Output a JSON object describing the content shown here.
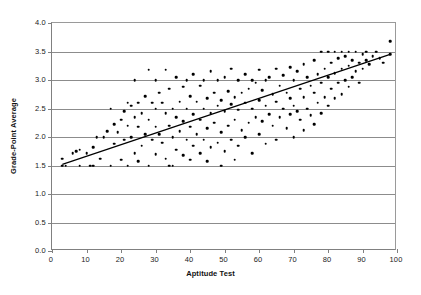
{
  "chart_data": {
    "type": "scatter",
    "title": "",
    "xlabel": "Aptitude Test",
    "ylabel": "Grade-Point Average",
    "xlim": [
      0,
      100
    ],
    "ylim": [
      0.0,
      4.0
    ],
    "xticks": [
      "0",
      "10",
      "20",
      "30",
      "40",
      "50",
      "60",
      "70",
      "80",
      "90",
      "100"
    ],
    "yticks": [
      "0.0",
      "0.5",
      "1.0",
      "1.5",
      "2.0",
      "2.5",
      "3.0",
      "3.5",
      "4.0"
    ],
    "grid": "horizontal",
    "legend": "none",
    "marker_color": "#000000",
    "gridline_color": "#8c8c8c",
    "axis_color": "#808080",
    "trendline": {
      "label": "linear fit",
      "color": "#000000",
      "x_start": 3,
      "y_start": 1.52,
      "x_end": 98,
      "y_end": 3.45
    },
    "points": [
      [
        3,
        1.5
      ],
      [
        3,
        1.62
      ],
      [
        4,
        1.5
      ],
      [
        6,
        1.72
      ],
      [
        7,
        1.75
      ],
      [
        8,
        1.78
      ],
      [
        8,
        1.5
      ],
      [
        10,
        1.72
      ],
      [
        11,
        1.5
      ],
      [
        12,
        1.82
      ],
      [
        12,
        1.5
      ],
      [
        13,
        2.0
      ],
      [
        14,
        1.62
      ],
      [
        15,
        2.0
      ],
      [
        16,
        2.1
      ],
      [
        17,
        2.5
      ],
      [
        17,
        1.5
      ],
      [
        18,
        2.22
      ],
      [
        18,
        1.88
      ],
      [
        19,
        2.08
      ],
      [
        20,
        2.3
      ],
      [
        20,
        1.6
      ],
      [
        21,
        2.45
      ],
      [
        21,
        1.95
      ],
      [
        22,
        2.6
      ],
      [
        22,
        2.2
      ],
      [
        22,
        1.5
      ],
      [
        23,
        2.55
      ],
      [
        23,
        2.0
      ],
      [
        24,
        3.0
      ],
      [
        24,
        2.35
      ],
      [
        24,
        1.72
      ],
      [
        25,
        2.6
      ],
      [
        25,
        2.18
      ],
      [
        25,
        1.58
      ],
      [
        26,
        2.42
      ],
      [
        26,
        1.85
      ],
      [
        27,
        2.72
      ],
      [
        27,
        2.05
      ],
      [
        28,
        3.18
      ],
      [
        28,
        2.3
      ],
      [
        28,
        1.5
      ],
      [
        29,
        2.6
      ],
      [
        29,
        1.95
      ],
      [
        30,
        3.0
      ],
      [
        30,
        2.5
      ],
      [
        30,
        2.18
      ],
      [
        30,
        1.7
      ],
      [
        31,
        2.78
      ],
      [
        31,
        2.05
      ],
      [
        32,
        2.6
      ],
      [
        32,
        1.9
      ],
      [
        33,
        3.18
      ],
      [
        33,
        2.42
      ],
      [
        33,
        1.62
      ],
      [
        34,
        2.85
      ],
      [
        34,
        2.2
      ],
      [
        34,
        1.5
      ],
      [
        35,
        2.5
      ],
      [
        35,
        2.0
      ],
      [
        35,
        1.5
      ],
      [
        36,
        3.05
      ],
      [
        36,
        2.35
      ],
      [
        36,
        1.78
      ],
      [
        37,
        2.62
      ],
      [
        37,
        2.1
      ],
      [
        38,
        2.88
      ],
      [
        38,
        2.28
      ],
      [
        38,
        1.68
      ],
      [
        39,
        3.0
      ],
      [
        39,
        2.5
      ],
      [
        39,
        1.95
      ],
      [
        40,
        2.72
      ],
      [
        40,
        2.18
      ],
      [
        40,
        1.6
      ],
      [
        41,
        3.1
      ],
      [
        41,
        2.4
      ],
      [
        41,
        1.85
      ],
      [
        42,
        2.62
      ],
      [
        42,
        2.05
      ],
      [
        43,
        2.9
      ],
      [
        43,
        2.3
      ],
      [
        43,
        1.72
      ],
      [
        44,
        3.0
      ],
      [
        44,
        2.5
      ],
      [
        44,
        1.95
      ],
      [
        45,
        2.68
      ],
      [
        45,
        2.15
      ],
      [
        45,
        1.58
      ],
      [
        46,
        3.15
      ],
      [
        46,
        2.42
      ],
      [
        46,
        1.82
      ],
      [
        47,
        2.78
      ],
      [
        47,
        2.25
      ],
      [
        48,
        3.0
      ],
      [
        48,
        2.55
      ],
      [
        48,
        1.9
      ],
      [
        49,
        2.65
      ],
      [
        49,
        2.08
      ],
      [
        49,
        1.5
      ],
      [
        50,
        3.05
      ],
      [
        50,
        2.45
      ],
      [
        50,
        1.75
      ],
      [
        51,
        2.8
      ],
      [
        51,
        2.2
      ],
      [
        52,
        3.2
      ],
      [
        52,
        2.58
      ],
      [
        52,
        1.95
      ],
      [
        53,
        2.7
      ],
      [
        53,
        2.3
      ],
      [
        53,
        1.6
      ],
      [
        54,
        3.0
      ],
      [
        54,
        2.48
      ],
      [
        54,
        1.85
      ],
      [
        55,
        2.78
      ],
      [
        55,
        2.12
      ],
      [
        56,
        3.1
      ],
      [
        56,
        2.6
      ],
      [
        56,
        2.0
      ],
      [
        57,
        2.85
      ],
      [
        57,
        2.25
      ],
      [
        58,
        3.0
      ],
      [
        58,
        2.5
      ],
      [
        58,
        1.72
      ],
      [
        59,
        2.95
      ],
      [
        59,
        2.35
      ],
      [
        60,
        3.18
      ],
      [
        60,
        2.65
      ],
      [
        60,
        2.05
      ],
      [
        61,
        2.82
      ],
      [
        61,
        2.28
      ],
      [
        62,
        3.0
      ],
      [
        62,
        2.55
      ],
      [
        62,
        1.88
      ],
      [
        63,
        3.05
      ],
      [
        63,
        2.4
      ],
      [
        64,
        2.75
      ],
      [
        64,
        2.2
      ],
      [
        65,
        3.2
      ],
      [
        65,
        2.62
      ],
      [
        65,
        1.95
      ],
      [
        66,
        2.9
      ],
      [
        66,
        2.35
      ],
      [
        67,
        3.08
      ],
      [
        67,
        2.5
      ],
      [
        68,
        2.78
      ],
      [
        68,
        2.15
      ],
      [
        69,
        3.22
      ],
      [
        69,
        2.68
      ],
      [
        69,
        2.4
      ],
      [
        70,
        3.0
      ],
      [
        70,
        2.55
      ],
      [
        70,
        2.0
      ],
      [
        71,
        3.15
      ],
      [
        71,
        2.45
      ],
      [
        72,
        2.85
      ],
      [
        72,
        2.3
      ],
      [
        73,
        3.28
      ],
      [
        73,
        2.7
      ],
      [
        73,
        2.12
      ],
      [
        74,
        3.05
      ],
      [
        74,
        2.5
      ],
      [
        75,
        2.9
      ],
      [
        75,
        2.38
      ],
      [
        76,
        3.35
      ],
      [
        76,
        2.78
      ],
      [
        76,
        2.22
      ],
      [
        77,
        3.1
      ],
      [
        77,
        2.6
      ],
      [
        78,
        3.5
      ],
      [
        78,
        2.95
      ],
      [
        78,
        2.42
      ],
      [
        79,
        3.2
      ],
      [
        79,
        2.7
      ],
      [
        80,
        3.5
      ],
      [
        80,
        3.05
      ],
      [
        80,
        2.55
      ],
      [
        81,
        3.3
      ],
      [
        81,
        2.85
      ],
      [
        82,
        3.5
      ],
      [
        82,
        3.12
      ],
      [
        82,
        2.68
      ],
      [
        83,
        3.38
      ],
      [
        83,
        2.95
      ],
      [
        84,
        3.5
      ],
      [
        84,
        3.2
      ],
      [
        84,
        2.75
      ],
      [
        85,
        3.42
      ],
      [
        85,
        3.0
      ],
      [
        86,
        3.5
      ],
      [
        86,
        3.25
      ],
      [
        86,
        2.88
      ],
      [
        87,
        3.35
      ],
      [
        87,
        3.05
      ],
      [
        88,
        3.5
      ],
      [
        88,
        3.15
      ],
      [
        89,
        3.3
      ],
      [
        89,
        2.95
      ],
      [
        90,
        3.45
      ],
      [
        90,
        3.2
      ],
      [
        91,
        3.5
      ],
      [
        91,
        3.35
      ],
      [
        92,
        3.28
      ],
      [
        93,
        3.42
      ],
      [
        94,
        3.5
      ],
      [
        95,
        3.38
      ],
      [
        96,
        3.3
      ],
      [
        98,
        3.68
      ],
      [
        98,
        3.45
      ]
    ]
  }
}
